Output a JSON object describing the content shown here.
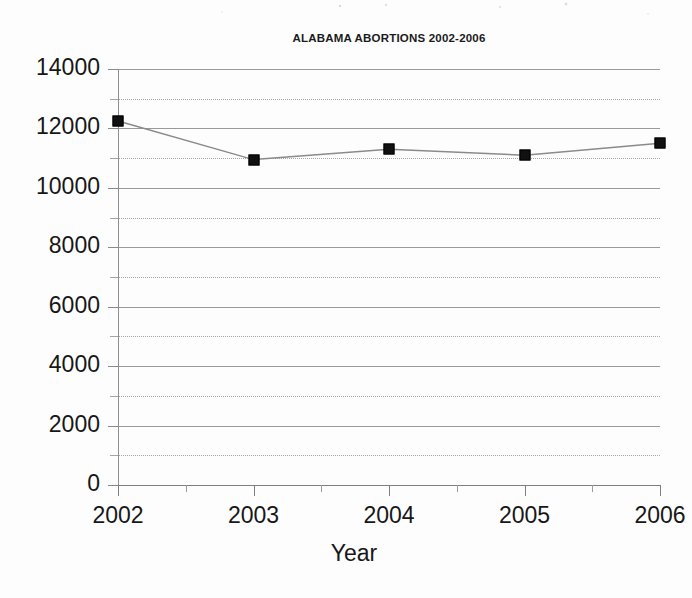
{
  "chart_data": {
    "type": "line",
    "title": "ALABAMA ABORTIONS 2002-2006",
    "xlabel": "Year",
    "ylabel": "",
    "categories": [
      "2002",
      "2003",
      "2004",
      "2005",
      "2006"
    ],
    "x": [
      2002,
      2003,
      2004,
      2005,
      2006
    ],
    "series": [
      {
        "name": "Abortions",
        "values": [
          12250,
          10950,
          11300,
          11100,
          11500
        ],
        "marker": "filled-square",
        "marker_color": "#111111",
        "line_color": "#8a8a8a"
      }
    ],
    "ylim": [
      0,
      14000
    ],
    "xlim": [
      2002,
      2006
    ],
    "y_ticks": [
      0,
      2000,
      4000,
      6000,
      8000,
      10000,
      12000,
      14000
    ],
    "y_tick_labels": [
      "0",
      "2000",
      "4000",
      "6000",
      "8000",
      "10000",
      "12000",
      "14000"
    ],
    "y_minor_ticks": [
      1000,
      3000,
      5000,
      7000,
      9000,
      11000,
      13000
    ],
    "x_ticks": [
      2002,
      2003,
      2004,
      2005,
      2006
    ],
    "x_tick_labels": [
      "2002",
      "2003",
      "2004",
      "2005",
      "2006"
    ],
    "grid": {
      "major_horizontal": true,
      "minor_horizontal_dotted": true,
      "vertical": false
    },
    "legend": {
      "visible": false,
      "position": "none",
      "entries": []
    },
    "annotations": []
  },
  "axis": {
    "y_title": "",
    "x_title": "Year"
  }
}
